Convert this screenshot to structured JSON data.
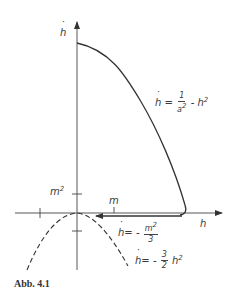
{
  "figure": {
    "caption": "Abb. 4.1",
    "axes": {
      "x_label": "h",
      "y_label": "ḣ",
      "x_tick_label": "m",
      "y_tick_label": "m",
      "y_tick_exponent": "2"
    },
    "curves": [
      {
        "name": "upper-curve",
        "style": "solid",
        "equation": {
          "lhs": "ḣ",
          "num": "1",
          "den": "a",
          "den_sub": "0",
          "den_sup": "2",
          "rest": "- h",
          "rest_sup": "2"
        }
      },
      {
        "name": "return-line",
        "style": "solid-arrow",
        "equation": {
          "lhs": "ḣ",
          "sign": "=",
          "neg": "-",
          "num": "m",
          "num_sup": "2",
          "den": "3"
        }
      },
      {
        "name": "lower-parabola",
        "style": "dashed",
        "equation": {
          "lhs": "ḣ",
          "sign": "=",
          "neg": "-",
          "num": "3",
          "den": "2",
          "rest": "h",
          "rest_sup": "2"
        }
      }
    ],
    "colors": {
      "ink": "#3a3a3a",
      "background": "#ffffff"
    }
  }
}
